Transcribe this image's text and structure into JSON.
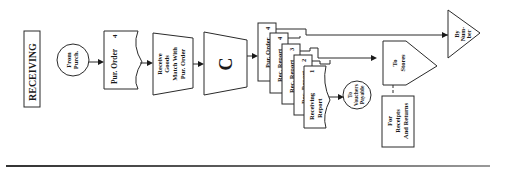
{
  "title": "RECEIVING",
  "nodes": {
    "from_purch": {
      "line1": "From",
      "line2": "Purch."
    },
    "pur_order": {
      "label": "Pur. Order",
      "copy": "4"
    },
    "receive_goods": {
      "line1": "Receive",
      "line2": "Goods",
      "line3": "Match With",
      "line4": "Pur. Order"
    },
    "manual_op": {
      "label": "C"
    },
    "doc_stack": [
      {
        "label": "Pur. Order",
        "copy": "4"
      },
      {
        "label": "Rec. Report",
        "copy": "4"
      },
      {
        "label": "Rec. Report",
        "copy": "3"
      },
      {
        "label": "Rec. Report",
        "copy": "2"
      },
      {
        "label": "Receiving",
        "label2": "Report",
        "copy": "1"
      }
    ],
    "to_vouchers": {
      "line1": "To",
      "line2": "Vouchers",
      "line3": "Payable"
    },
    "to_stores": {
      "line1": "To",
      "line2": "Stores"
    },
    "by_number": {
      "line1": "By",
      "line2": "Num-",
      "line3": "ber"
    },
    "for_receipts": {
      "line1": "For",
      "line2": "Receipts",
      "line3": "And Returns"
    }
  },
  "colors": {
    "ink": "#1a1a1a",
    "paper": "#ffffff"
  }
}
